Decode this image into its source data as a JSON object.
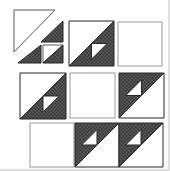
{
  "diagram": {
    "canvas": {
      "width": 170,
      "height": 171,
      "background": "#ffffff",
      "edge_shadow": "#dedede"
    },
    "palette": {
      "white_fill": "#ffffff",
      "dark_fill": "#3a3a3a",
      "dot_color": "#bfbfbf",
      "dark_stroke": "#262626",
      "light_stroke": "#5a5a5a",
      "frame_stroke": "#999999"
    },
    "dot_pattern": {
      "size": 3.6,
      "radius": 0.55,
      "offsets": [
        [
          0.9,
          0.9
        ],
        [
          2.7,
          2.7
        ]
      ]
    },
    "small_triangle_ratio": 0.35,
    "loose_pieces": [
      {
        "name": "exploded-large-white-triangle",
        "points": [
          [
            14,
            10
          ],
          [
            55,
            10
          ],
          [
            14,
            52
          ]
        ],
        "fill": "white",
        "stroke": "light"
      },
      {
        "name": "exploded-dark-triangle-upper",
        "points": [
          [
            63,
            21
          ],
          [
            63,
            42
          ],
          [
            41,
            42
          ]
        ],
        "fill": "dark",
        "stroke": "dark"
      },
      {
        "name": "exploded-dark-triangle-lower",
        "points": [
          [
            18,
            63
          ],
          [
            41,
            63
          ],
          [
            41,
            45
          ]
        ],
        "fill": "dark",
        "stroke": "dark"
      },
      {
        "name": "exploded-hst-white-triangle",
        "points": [
          [
            43,
            45
          ],
          [
            63,
            45
          ],
          [
            43,
            63
          ]
        ],
        "fill": "white",
        "stroke": "light"
      },
      {
        "name": "exploded-hst-dark-triangle",
        "points": [
          [
            63,
            45
          ],
          [
            63,
            63
          ],
          [
            43,
            63
          ]
        ],
        "fill": "dark",
        "stroke": "dark"
      }
    ],
    "blocks": [
      {
        "name": "block-r1-c2",
        "x": 69,
        "y": 21,
        "size": 45,
        "kind": "hst_white_tl"
      },
      {
        "name": "block-r1-c3",
        "x": 118,
        "y": 22,
        "size": 44,
        "kind": "plain"
      },
      {
        "name": "block-r2-c1",
        "x": 20,
        "y": 73,
        "size": 46,
        "kind": "hst_white_tl"
      },
      {
        "name": "block-r2-c2",
        "x": 70,
        "y": 73,
        "size": 45,
        "kind": "plain"
      },
      {
        "name": "block-r2-c3",
        "x": 119,
        "y": 73,
        "size": 45,
        "kind": "hst_white_br"
      },
      {
        "name": "block-r3-c1",
        "x": 30,
        "y": 123,
        "size": 44,
        "kind": "plain"
      },
      {
        "name": "block-r3-c2",
        "x": 75,
        "y": 123,
        "size": 44,
        "kind": "hst_white_br"
      },
      {
        "name": "block-r3-c3",
        "x": 119,
        "y": 123,
        "size": 44,
        "kind": "hst_white_br"
      }
    ]
  }
}
